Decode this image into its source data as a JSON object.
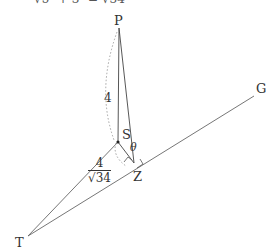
{
  "diagram": {
    "top_fragment": "√5² + 3²   =   √34",
    "points": {
      "P": {
        "label": "P",
        "x": 119,
        "y": 28
      },
      "S": {
        "label": "S",
        "x": 118,
        "y": 142
      },
      "Z": {
        "label": "Z",
        "x": 134,
        "y": 163
      },
      "T": {
        "label": "T",
        "x": 28,
        "y": 236
      },
      "G": {
        "label": "G",
        "x": 254,
        "y": 96
      }
    },
    "labels": {
      "P": "P",
      "S": "S",
      "Z": "Z",
      "T": "T",
      "G": "G",
      "theta": "θ",
      "ps_length": "4",
      "sz_numerator": "4",
      "sz_denominator": "√34"
    },
    "colors": {
      "line": "#555555",
      "dotted": "#999999",
      "text": "#333333"
    }
  }
}
